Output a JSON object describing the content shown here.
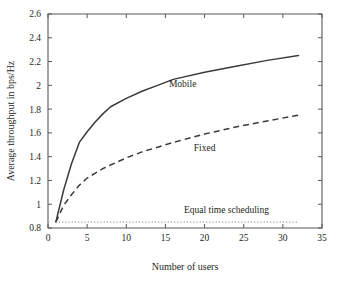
{
  "chart_data": {
    "type": "line",
    "title": "",
    "xlabel": "Number of users",
    "ylabel": "Average throughput in bps/Hz",
    "xlim": [
      0,
      35
    ],
    "ylim": [
      0.8,
      2.6
    ],
    "xticks": [
      "0",
      "5",
      "10",
      "15",
      "20",
      "25",
      "30",
      "35"
    ],
    "xtick_values": [
      0,
      5,
      10,
      15,
      20,
      25,
      30,
      35
    ],
    "yticks": [
      "0.8",
      "1",
      "1.2",
      "1.4",
      "1.6",
      "1.8",
      "2",
      "2.2",
      "2.4",
      "2.6"
    ],
    "ytick_values": [
      0.8,
      1.0,
      1.2,
      1.4,
      1.6,
      1.8,
      2.0,
      2.2,
      2.4,
      2.6
    ],
    "grid": false,
    "legend_position": "inline-annotations",
    "series": [
      {
        "name": "Mobile",
        "style": "solid",
        "color": "#3a3a3c",
        "x": [
          1,
          2,
          3,
          4,
          5,
          6,
          7,
          8,
          10,
          12,
          14,
          16,
          20,
          24,
          28,
          32
        ],
        "values": [
          0.85,
          1.12,
          1.34,
          1.52,
          1.61,
          1.69,
          1.76,
          1.82,
          1.89,
          1.95,
          2.0,
          2.05,
          2.11,
          2.16,
          2.21,
          2.25
        ]
      },
      {
        "name": "Fixed",
        "style": "dashed",
        "color": "#3a3a3c",
        "x": [
          1,
          2,
          3,
          4,
          5,
          6,
          7,
          8,
          10,
          12,
          14,
          16,
          20,
          24,
          28,
          32
        ],
        "values": [
          0.85,
          0.99,
          1.08,
          1.16,
          1.22,
          1.26,
          1.3,
          1.33,
          1.39,
          1.44,
          1.48,
          1.52,
          1.59,
          1.65,
          1.7,
          1.75
        ]
      },
      {
        "name": "Equal time scheduling",
        "style": "dotted",
        "color": "#8d8e90",
        "x": [
          1,
          32
        ],
        "values": [
          0.85,
          0.85
        ]
      }
    ],
    "annotations": [
      {
        "text": "Mobile",
        "x": 17.2,
        "y": 1.99
      },
      {
        "text": "Fixed",
        "x": 20.0,
        "y": 1.45
      },
      {
        "text": "Equal time scheduling",
        "x": 22.8,
        "y": 0.93
      }
    ]
  }
}
